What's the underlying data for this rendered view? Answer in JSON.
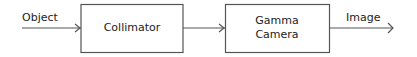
{
  "diagram": {
    "type": "block-flow",
    "input_label": "Object",
    "output_label": "Image",
    "blocks": [
      {
        "lines": [
          "Collimator"
        ]
      },
      {
        "lines": [
          "Gamma",
          "Camera"
        ]
      }
    ],
    "colors": {
      "stroke": "#555555",
      "text": "#222222",
      "background": "#ffffff"
    }
  }
}
